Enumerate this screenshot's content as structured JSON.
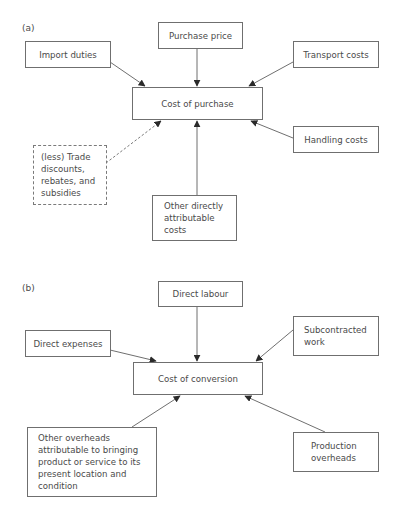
{
  "diagram_a": {
    "label": "(a)",
    "center": "Cost of purchase",
    "nodes": {
      "purchase_price": "Purchase price",
      "import_duties": "Import duties",
      "transport_costs": "Transport costs",
      "handling_costs": "Handling costs",
      "trade_discounts": "(less) Trade\ndiscounts,\nrebates, and\nsubsidies",
      "other_direct": "Other directly\nattributable\ncosts"
    }
  },
  "diagram_b": {
    "label": "(b)",
    "center": "Cost of conversion",
    "nodes": {
      "direct_labour": "Direct labour",
      "direct_expenses": "Direct expenses",
      "subcontracted_work": "Subcontracted\nwork",
      "other_overheads": "Other overheads\nattributable to bringing\nproduct or service to its\npresent location  and\ncondition",
      "production_overheads": "Production\noverheads"
    }
  },
  "colors": {
    "line": "#6f6f6f",
    "arrowhead": "#2a2a2a",
    "text": "#4a4a4a"
  }
}
